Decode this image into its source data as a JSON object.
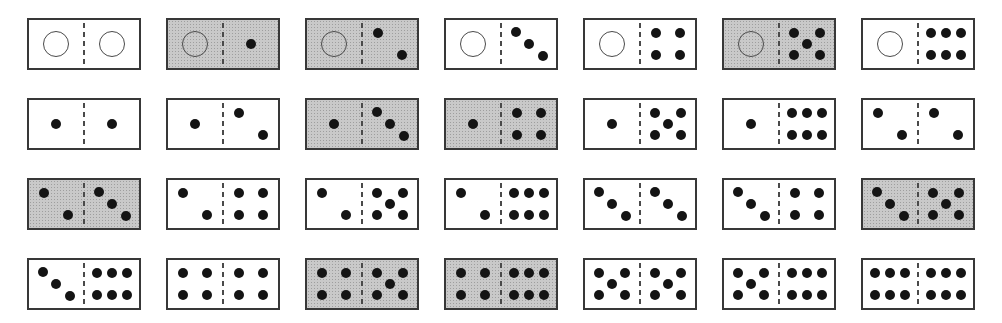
{
  "domino_grid": {
    "rows": [
      {
        "tiles": [
          {
            "left": 0,
            "right": 0,
            "shaded": false
          },
          {
            "left": 0,
            "right": 1,
            "shaded": true
          },
          {
            "left": 0,
            "right": 2,
            "shaded": true
          },
          {
            "left": 0,
            "right": 3,
            "shaded": false
          },
          {
            "left": 0,
            "right": 4,
            "shaded": false
          },
          {
            "left": 0,
            "right": 5,
            "shaded": true
          },
          {
            "left": 0,
            "right": 6,
            "shaded": false
          }
        ]
      },
      {
        "tiles": [
          {
            "left": 1,
            "right": 1,
            "shaded": false
          },
          {
            "left": 1,
            "right": 2,
            "shaded": false
          },
          {
            "left": 1,
            "right": 3,
            "shaded": true
          },
          {
            "left": 1,
            "right": 4,
            "shaded": true
          },
          {
            "left": 1,
            "right": 5,
            "shaded": false
          },
          {
            "left": 1,
            "right": 6,
            "shaded": false
          },
          {
            "left": 2,
            "right": 2,
            "shaded": false
          }
        ]
      },
      {
        "tiles": [
          {
            "left": 2,
            "right": 3,
            "shaded": true
          },
          {
            "left": 2,
            "right": 4,
            "shaded": false
          },
          {
            "left": 2,
            "right": 5,
            "shaded": false
          },
          {
            "left": 2,
            "right": 6,
            "shaded": false
          },
          {
            "left": 3,
            "right": 3,
            "shaded": false
          },
          {
            "left": 3,
            "right": 4,
            "shaded": false
          },
          {
            "left": 3,
            "right": 5,
            "shaded": true
          }
        ]
      },
      {
        "tiles": [
          {
            "left": 3,
            "right": 6,
            "shaded": false
          },
          {
            "left": 4,
            "right": 4,
            "shaded": false
          },
          {
            "left": 4,
            "right": 5,
            "shaded": true
          },
          {
            "left": 4,
            "right": 6,
            "shaded": true
          },
          {
            "left": 5,
            "right": 5,
            "shaded": false
          },
          {
            "left": 5,
            "right": 6,
            "shaded": false
          },
          {
            "left": 6,
            "right": 6,
            "shaded": false
          }
        ]
      }
    ]
  },
  "colors": {
    "page_bg": "#ffffff",
    "tile_fill": "#ffffff",
    "shaded_fill": "#c9c9c9",
    "shaded_speckle": "#9e9e9e",
    "tile_border": "#383838",
    "divider": "#4a4a4a",
    "pip": "#141414",
    "blank_ring": "#4a4a4a"
  }
}
